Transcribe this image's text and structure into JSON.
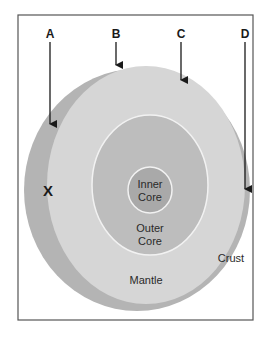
{
  "diagram": {
    "pointers": [
      {
        "id": "A",
        "label": "A"
      },
      {
        "id": "B",
        "label": "B"
      },
      {
        "id": "C",
        "label": "C"
      },
      {
        "id": "D",
        "label": "D"
      }
    ],
    "marker": {
      "label": "X"
    },
    "layers": {
      "inner_core": {
        "line1": "Inner",
        "line2": "Core"
      },
      "outer_core": {
        "line1": "Outer",
        "line2": "Core"
      },
      "mantle": {
        "label": "Mantle"
      },
      "crust": {
        "label": "Crust"
      }
    },
    "colors": {
      "frame": "#555555",
      "crust_edge": "#b4b4b4",
      "mantle_face": "#d6d6d6",
      "outer_core": "#bdbdbd",
      "inner_core": "#a9a9a9",
      "boundary": "#f2f2f2",
      "arrow": "#1a1a1a"
    }
  }
}
